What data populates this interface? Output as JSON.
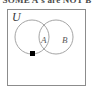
{
  "caption_sliver": {
    "text": "SOME A's are NOT B"
  },
  "diagram": {
    "type": "venn",
    "universe_label": "U",
    "sets": [
      {
        "id": "A",
        "label": "A",
        "position": "left"
      },
      {
        "id": "B",
        "label": "B",
        "position": "right"
      }
    ],
    "elements": [
      {
        "marker": "filled-square",
        "color": "#000000",
        "region": "A only",
        "description": "point inside circle A and outside circle B"
      }
    ],
    "regions": [
      "A only",
      "A intersect B",
      "B only",
      "outside A and B (within U)"
    ],
    "colors": {
      "border": "#8c8c8c",
      "circle_stroke": "#9a9a9a",
      "background": "#ffffff",
      "label_text": "#5a5a5a",
      "universe_text": "#3a3a3a",
      "point_fill": "#000000"
    },
    "geometry": {
      "universe_rect": {
        "x": 7,
        "y": 9,
        "width": 79,
        "height": 77
      },
      "circle_a": {
        "cx": 31,
        "cy": 36,
        "r": 17
      },
      "circle_b": {
        "cx": 55,
        "cy": 36,
        "r": 17
      },
      "point": {
        "x": 24,
        "y": 43
      }
    }
  }
}
